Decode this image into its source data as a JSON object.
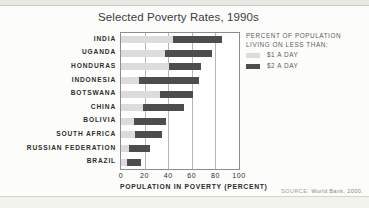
{
  "title": "Selected Poverty Rates, 1990s",
  "source": {
    "prefix": "SOURCE:",
    "text": "World Bank, 2000."
  },
  "legend": {
    "heading_line1": "PERCENT OF POPULATION",
    "heading_line2": "LIVING ON LESS THAN:",
    "entries": [
      {
        "label": "$1 A DAY",
        "color": "#dcdcdc"
      },
      {
        "label": "$2 A DAY",
        "color": "#4d4d4d"
      }
    ]
  },
  "axis": {
    "xlabel": "POPULATION IN POVERTY (PERCENT)",
    "ticks": [
      "0",
      "20",
      "40",
      "60",
      "80",
      "100"
    ]
  },
  "chart_data": {
    "type": "bar",
    "title": "Selected Poverty Rates, 1990s",
    "xlabel": "POPULATION IN POVERTY (PERCENT)",
    "ylabel": "",
    "xlim": [
      0,
      100
    ],
    "grid": true,
    "legend_position": "right",
    "categories": [
      "INDIA",
      "UGANDA",
      "HONDURAS",
      "INDONESIA",
      "BOTSWANA",
      "CHINA",
      "BOLIVIA",
      "SOUTH AFRICA",
      "RUSSIAN FEDERATION",
      "BRAZIL"
    ],
    "series": [
      {
        "name": "$1 A DAY",
        "color": "#dcdcdc",
        "values": [
          44,
          37,
          41,
          15,
          33,
          19,
          11,
          12,
          7,
          5
        ]
      },
      {
        "name": "$2 A DAY",
        "color": "#4d4d4d",
        "values": [
          86,
          77,
          68,
          66,
          61,
          53,
          38,
          35,
          25,
          17
        ]
      }
    ]
  }
}
